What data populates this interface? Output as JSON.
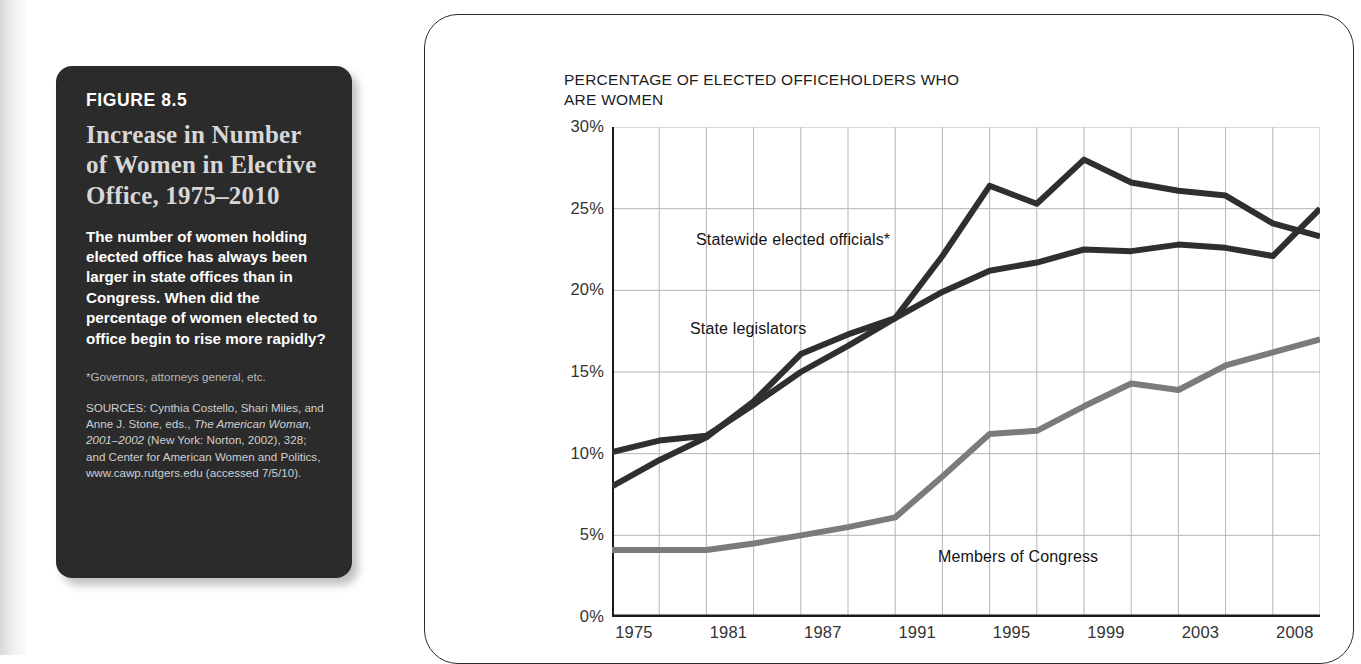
{
  "figure": {
    "label": "FIGURE 8.5",
    "title": "Increase in Number of Women in Elective Office, 1975–2010",
    "description": "The number of women holding elected office has always been larger in state offices than in Congress. When did the percentage of women elected to office begin to rise more rapidly?",
    "footnote": "*Governors, attorneys general, etc.",
    "sources_part1": "SOURCES: Cynthia Costello, Shari Miles, and Anne J. Stone, eds., ",
    "sources_italic": "The American Woman, 2001–2002",
    "sources_part2": " (New York: Norton, 2002), 328; and Center for American Women and Politics, www.cawp.rutgers.edu (accessed 7/5/10)."
  },
  "chart_data": {
    "type": "line",
    "title": "PERCENTAGE OF ELECTED OFFICEHOLDERS WHO ARE WOMEN",
    "xlabel": "",
    "ylabel": "",
    "ylim": [
      0,
      30
    ],
    "yticks": [
      0,
      5,
      10,
      15,
      20,
      25,
      30
    ],
    "ytick_labels": [
      "0%",
      "5%",
      "10%",
      "15%",
      "20%",
      "25%",
      "30%"
    ],
    "grid": true,
    "legend_position": "inline-annotations",
    "xtick_labels": [
      "1975",
      "1981",
      "1987",
      "1991",
      "1995",
      "1999",
      "2003",
      "2008"
    ],
    "xtick_positions": [
      0,
      1,
      2,
      3,
      4,
      5,
      6,
      7
    ],
    "x": [
      0,
      0.5,
      1,
      1.5,
      2,
      2.5,
      3,
      3.5,
      4,
      4.5,
      5,
      5.5,
      6,
      6.5,
      7,
      7.5
    ],
    "series": [
      {
        "name": "Statewide elected officials*",
        "color": "#2f2f2f",
        "label_x": 696,
        "label_y": 231,
        "values": [
          8.0,
          9.6,
          11.0,
          13.2,
          16.1,
          17.3,
          18.3,
          22.1,
          26.4,
          25.3,
          28.0,
          26.6,
          26.1,
          25.8,
          24.1,
          23.3
        ]
      },
      {
        "name": "State legislators",
        "color": "#2f2f2f",
        "label_x": 690,
        "label_y": 320,
        "values": [
          10.1,
          10.8,
          11.1,
          13.0,
          15.0,
          16.6,
          18.3,
          19.9,
          21.2,
          21.7,
          22.5,
          22.4,
          22.8,
          22.6,
          22.1,
          25.0
        ]
      },
      {
        "name": "Members of Congress",
        "color": "#7b7b7b",
        "label_x": 938,
        "label_y": 548,
        "values": [
          4.1,
          4.1,
          4.1,
          4.5,
          5.0,
          5.5,
          6.1,
          8.6,
          11.2,
          11.4,
          12.9,
          14.3,
          13.9,
          15.4,
          16.2,
          17.0
        ]
      }
    ]
  }
}
